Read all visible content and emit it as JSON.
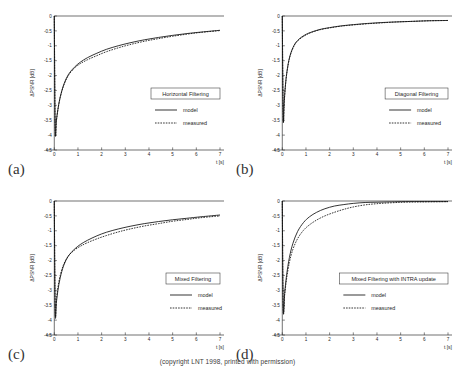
{
  "figure": {
    "caption": "(copyright LNT 1998, printed with permission)",
    "panel_labels": [
      "(a)",
      "(b)",
      "(c)",
      "(d)"
    ]
  },
  "chart_data": [
    {
      "type": "line",
      "panel": "(a)",
      "title": "Horizontal Filtering",
      "xlabel": "t [s]",
      "ylabel": "ΔPSNR [dB]",
      "xlim": [
        -0.35,
        7
      ],
      "ylim": [
        -4.5,
        0
      ],
      "xticks": [
        0,
        1,
        2,
        3,
        4,
        5,
        6,
        7
      ],
      "xticklabels": [
        "0",
        "1",
        "2",
        "3",
        "4",
        "5",
        "6",
        "7"
      ],
      "yticks": [
        0,
        -0.5,
        -1,
        -1.5,
        -2,
        -2.5,
        -3,
        -3.5,
        -4,
        -4.5
      ],
      "yticklabels": [
        "0",
        "-0.5",
        "-1",
        "-1.5",
        "-2",
        "-2.5",
        "-3",
        "-3.5",
        "-4",
        "-4.5"
      ],
      "grid": false,
      "legend_position": "lower right",
      "series": [
        {
          "name": "model",
          "style": "solid",
          "x": [
            0,
            0.04,
            0.09,
            0.15,
            0.25,
            0.4,
            0.6,
            0.85,
            1.1,
            1.4,
            1.8,
            2.2,
            2.7,
            3.2,
            3.8,
            4.4,
            5.0,
            5.6,
            6.2,
            7.0
          ],
          "y": [
            0,
            -3.82,
            -3.5,
            -3.15,
            -2.72,
            -2.3,
            -1.96,
            -1.72,
            -1.55,
            -1.4,
            -1.25,
            -1.12,
            -1.0,
            -0.9,
            -0.8,
            -0.72,
            -0.65,
            -0.59,
            -0.54,
            -0.48
          ]
        },
        {
          "name": "measured",
          "style": "dotted",
          "x": [
            0,
            0.04,
            0.09,
            0.15,
            0.25,
            0.4,
            0.6,
            0.85,
            1.1,
            1.4,
            1.8,
            2.2,
            2.7,
            3.2,
            3.8,
            4.4,
            5.0,
            5.6,
            6.2,
            7.0
          ],
          "y": [
            0,
            -3.84,
            -3.52,
            -3.16,
            -2.74,
            -2.33,
            -1.99,
            -1.75,
            -1.6,
            -1.47,
            -1.33,
            -1.2,
            -1.07,
            -0.96,
            -0.85,
            -0.76,
            -0.68,
            -0.61,
            -0.55,
            -0.49
          ]
        }
      ]
    },
    {
      "type": "line",
      "panel": "(b)",
      "title": "Diagonal Filtering",
      "xlabel": "t [s]",
      "ylabel": "ΔPSNR [dB]",
      "xlim": [
        -0.35,
        7
      ],
      "ylim": [
        -4.5,
        0
      ],
      "xticks": [
        0,
        1,
        2,
        3,
        4,
        5,
        6,
        7
      ],
      "xticklabels": [
        "0",
        "1",
        "2",
        "3",
        "4",
        "5",
        "6",
        "7"
      ],
      "yticks": [
        0,
        -0.5,
        -1,
        -1.5,
        -2,
        -2.5,
        -3,
        -3.5,
        -4,
        -4.5
      ],
      "yticklabels": [
        "0",
        "-0.5",
        "-1",
        "-1.5",
        "-2",
        "-2.5",
        "-3",
        "-3.5",
        "-4",
        "-4.5"
      ],
      "grid": false,
      "legend_position": "lower right",
      "series": [
        {
          "name": "model",
          "style": "solid",
          "x": [
            0,
            0.04,
            0.08,
            0.13,
            0.2,
            0.32,
            0.5,
            0.7,
            0.95,
            1.2,
            1.6,
            2.0,
            2.5,
            3.0,
            3.6,
            4.2,
            4.8,
            5.5,
            6.2,
            7.0
          ],
          "y": [
            0,
            -3.42,
            -2.9,
            -2.35,
            -1.85,
            -1.35,
            -0.98,
            -0.78,
            -0.64,
            -0.55,
            -0.45,
            -0.39,
            -0.33,
            -0.29,
            -0.25,
            -0.22,
            -0.2,
            -0.18,
            -0.16,
            -0.15
          ]
        },
        {
          "name": "measured",
          "style": "dotted",
          "x": [
            0,
            0.04,
            0.08,
            0.13,
            0.2,
            0.32,
            0.5,
            0.7,
            0.95,
            1.2,
            1.6,
            2.0,
            2.5,
            3.0,
            3.6,
            4.2,
            4.8,
            5.5,
            6.2,
            7.0
          ],
          "y": [
            0,
            -3.44,
            -2.92,
            -2.37,
            -1.87,
            -1.37,
            -1.0,
            -0.8,
            -0.66,
            -0.56,
            -0.46,
            -0.4,
            -0.34,
            -0.3,
            -0.26,
            -0.23,
            -0.2,
            -0.18,
            -0.16,
            -0.15
          ]
        }
      ]
    },
    {
      "type": "line",
      "panel": "(c)",
      "title": "Mixed Filtering",
      "xlabel": "t [s]",
      "ylabel": "ΔPSNR [dB]",
      "xlim": [
        -0.35,
        7
      ],
      "ylim": [
        -4.5,
        0
      ],
      "xticks": [
        0,
        1,
        2,
        3,
        4,
        5,
        6,
        7
      ],
      "xticklabels": [
        "0",
        "1",
        "2",
        "3",
        "4",
        "5",
        "6",
        "7"
      ],
      "yticks": [
        0,
        -0.5,
        -1,
        -1.5,
        -2,
        -2.5,
        -3,
        -3.5,
        -4,
        -4.5
      ],
      "yticklabels": [
        "0",
        "-0.5",
        "-1",
        "-1.5",
        "-2",
        "-2.5",
        "-3",
        "-3.5",
        "-4",
        "-4.5"
      ],
      "grid": false,
      "legend_position": "lower right",
      "series": [
        {
          "name": "model",
          "style": "solid",
          "x": [
            0,
            0.04,
            0.09,
            0.15,
            0.25,
            0.4,
            0.6,
            0.85,
            1.1,
            1.4,
            1.8,
            2.2,
            2.7,
            3.2,
            3.8,
            4.4,
            5.0,
            5.6,
            6.2,
            7.0
          ],
          "y": [
            0,
            -3.74,
            -3.4,
            -3.02,
            -2.58,
            -2.16,
            -1.84,
            -1.62,
            -1.46,
            -1.32,
            -1.17,
            -1.05,
            -0.94,
            -0.85,
            -0.76,
            -0.69,
            -0.63,
            -0.58,
            -0.53,
            -0.47
          ]
        },
        {
          "name": "measured",
          "style": "dotted",
          "x": [
            0,
            0.04,
            0.09,
            0.15,
            0.25,
            0.4,
            0.6,
            0.85,
            1.1,
            1.4,
            1.8,
            2.2,
            2.7,
            3.2,
            3.8,
            4.4,
            5.0,
            5.6,
            6.2,
            7.0
          ],
          "y": [
            0,
            -3.7,
            -3.3,
            -2.92,
            -2.5,
            -2.12,
            -1.84,
            -1.65,
            -1.52,
            -1.4,
            -1.27,
            -1.16,
            -1.04,
            -0.94,
            -0.84,
            -0.76,
            -0.68,
            -0.62,
            -0.56,
            -0.5
          ]
        }
      ]
    },
    {
      "type": "line",
      "panel": "(d)",
      "title": "Mixed Filtering with INTRA update",
      "xlabel": "t [s]",
      "ylabel": "ΔPSNR [dB]",
      "xlim": [
        -0.35,
        7
      ],
      "ylim": [
        -4.5,
        0
      ],
      "xticks": [
        0,
        1,
        2,
        3,
        4,
        5,
        6,
        7
      ],
      "xticklabels": [
        "0",
        "1",
        "2",
        "3",
        "4",
        "5",
        "6",
        "7"
      ],
      "yticks": [
        0,
        -0.5,
        -1,
        -1.5,
        -2,
        -2.5,
        -3,
        -3.5,
        -4,
        -4.5
      ],
      "yticklabels": [
        "0",
        "-0.5",
        "-1",
        "-1.5",
        "-2",
        "-2.5",
        "-3",
        "-3.5",
        "-4",
        "-4.5"
      ],
      "grid": false,
      "legend_position": "lower right",
      "series": [
        {
          "name": "model",
          "style": "solid",
          "x": [
            0,
            0.04,
            0.1,
            0.18,
            0.3,
            0.45,
            0.65,
            0.9,
            1.15,
            1.45,
            1.8,
            2.2,
            2.6,
            3.0,
            3.5,
            4.0,
            4.6,
            5.2,
            6.0,
            7.0
          ],
          "y": [
            0,
            -3.62,
            -3.1,
            -2.5,
            -1.9,
            -1.42,
            -1.02,
            -0.72,
            -0.53,
            -0.38,
            -0.26,
            -0.17,
            -0.12,
            -0.08,
            -0.05,
            -0.04,
            -0.03,
            -0.02,
            -0.02,
            -0.02
          ]
        },
        {
          "name": "measured",
          "style": "dotted",
          "x": [
            0,
            0.04,
            0.1,
            0.18,
            0.3,
            0.45,
            0.65,
            0.9,
            1.15,
            1.45,
            1.8,
            2.2,
            2.6,
            3.0,
            3.5,
            4.0,
            4.6,
            5.2,
            6.0,
            7.0
          ],
          "y": [
            0,
            -3.64,
            -3.16,
            -2.62,
            -2.06,
            -1.62,
            -1.26,
            -0.98,
            -0.8,
            -0.64,
            -0.5,
            -0.38,
            -0.28,
            -0.2,
            -0.13,
            -0.09,
            -0.06,
            -0.04,
            -0.03,
            -0.02
          ]
        }
      ]
    }
  ]
}
